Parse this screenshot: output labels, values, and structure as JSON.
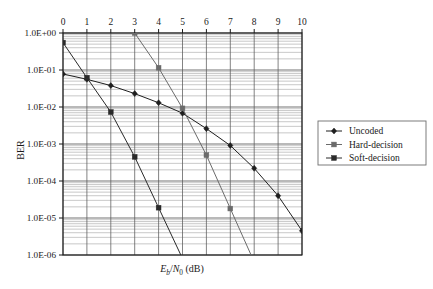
{
  "chart_data": {
    "type": "line",
    "title": "",
    "xlabel": "Eb/N0 (dB)",
    "xlabel_parts": {
      "e": "E",
      "b": "b",
      "slash": "/",
      "n": "N",
      "zero": "0",
      "unit": "(dB)"
    },
    "ylabel": "BER",
    "x_axis_position": "top",
    "xlim": [
      0,
      10
    ],
    "ylim": [
      1e-06,
      1.0
    ],
    "yscale": "log",
    "grid": true,
    "grid_minor": true,
    "legend_position": "right",
    "x_ticks": [
      0,
      1,
      2,
      3,
      4,
      5,
      6,
      7,
      8,
      9,
      10
    ],
    "x_tick_labels": [
      "0",
      "1",
      "2",
      "3",
      "4",
      "5",
      "6",
      "7",
      "8",
      "9",
      "10"
    ],
    "y_ticks": [
      1,
      0.1,
      0.01,
      0.001,
      0.0001,
      1e-05,
      1e-06
    ],
    "y_tick_labels": [
      "1.0E+00",
      "1.0E-01",
      "1.0E-02",
      "1.0E-03",
      "1.0E-04",
      "1.0E-05",
      "1.0E-06"
    ],
    "series": [
      {
        "name": "Uncoded",
        "marker": "diamond",
        "color": "#1f1f1f",
        "x": [
          0,
          1,
          2,
          3,
          4,
          5,
          6,
          7,
          8,
          9,
          10
        ],
        "values": [
          0.078,
          0.056,
          0.038,
          0.023,
          0.013,
          0.0068,
          0.0026,
          0.00091,
          0.00022,
          4e-05,
          4.5e-06
        ]
      },
      {
        "name": "Hard-decision",
        "marker": "square",
        "color": "#6b6b6b",
        "x": [
          3,
          4,
          5,
          6,
          7
        ],
        "values": [
          1.0,
          0.115,
          0.0092,
          0.0005,
          1.8e-05
        ]
      },
      {
        "name": "Soft-decision",
        "marker": "square",
        "color": "#2a2a2a",
        "x": [
          0,
          1,
          2,
          3,
          4
        ],
        "values": [
          0.55,
          0.062,
          0.0073,
          0.00045,
          1.9e-05
        ]
      }
    ]
  },
  "legend": {
    "entries": [
      {
        "label": "Uncoded"
      },
      {
        "label": "Hard-decision"
      },
      {
        "label": "Soft-decision"
      }
    ]
  },
  "colors": {
    "axis": "#1a1a1a",
    "grid_major": "#5a5a5a",
    "grid_minor": "#9a9a9a",
    "uncoded": "#1f1f1f",
    "hard": "#6b6b6b",
    "soft": "#2a2a2a",
    "background": "#ffffff"
  }
}
